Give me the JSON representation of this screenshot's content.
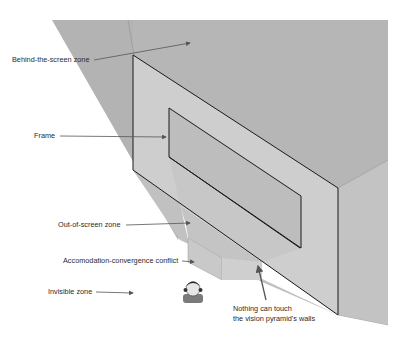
{
  "diagram": {
    "colors": {
      "behind_zone": "#b5b5b5",
      "frame_face": "#cdcdcd",
      "inner_frame": "#bdbdbd",
      "right_face": "#c4c4c4",
      "out_zone": "#c2c2c2",
      "conflict_box": "#c8c8c8",
      "edge": "#1a1a1a",
      "arrow": "#555555",
      "text": "#2b2b2b"
    },
    "labels": {
      "behind": "Behind-the-screen zone",
      "frame": "Frame",
      "out_of_screen": "Out-of-screen zone",
      "conflict": "Accomodation-convergence conflict",
      "invisible": "Invisible zone",
      "walls": "Nothing can touch\nthe vision pyramid's walls"
    },
    "viewer_icon": "person-head-icon"
  }
}
